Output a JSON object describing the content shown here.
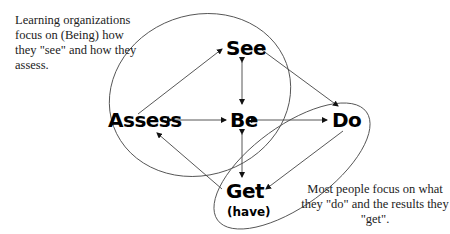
{
  "diagram": {
    "nodes": {
      "see": "See",
      "assess": "Assess",
      "be": "Be",
      "do": "Do",
      "get": "Get",
      "get_sub": "(have)"
    },
    "notes": {
      "learning_orgs": "Learning organizations focus on (Being) how they \"see\" and how they assess.",
      "most_people": "Most people focus on what they \"do\" and the results they \"get\"."
    },
    "edges": [
      {
        "from": "Assess",
        "to": "See",
        "type": "single-arrow"
      },
      {
        "from": "See",
        "to": "Be",
        "type": "double-arrow"
      },
      {
        "from": "See",
        "to": "Do",
        "type": "single-arrow"
      },
      {
        "from": "Assess",
        "to": "Be",
        "type": "double-arrow"
      },
      {
        "from": "Be",
        "to": "Do",
        "type": "double-arrow"
      },
      {
        "from": "Be",
        "to": "Get",
        "type": "double-arrow"
      },
      {
        "from": "Do",
        "to": "Get",
        "type": "single-arrow"
      },
      {
        "from": "Get",
        "to": "Assess",
        "type": "single-arrow"
      }
    ],
    "groups": [
      {
        "name": "being-group",
        "members": [
          "See",
          "Assess",
          "Be"
        ]
      },
      {
        "name": "doing-group",
        "members": [
          "Do",
          "Get"
        ]
      }
    ],
    "colors": {
      "text": "#000000",
      "lines": "#333333",
      "ellipse": "#555555",
      "background": "#ffffff"
    }
  }
}
